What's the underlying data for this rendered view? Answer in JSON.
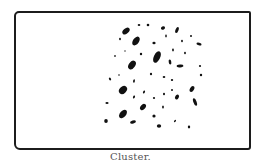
{
  "figure": {
    "caption": "Cluster.",
    "frame": {
      "x": 14,
      "y": 11,
      "width": 233,
      "height": 135,
      "stroke": "#1c1c1c"
    },
    "dot_color": "#111111",
    "dots": [
      {
        "x": 126,
        "y": 31,
        "rx": 4.2,
        "ry": 2.6,
        "rot": -40
      },
      {
        "x": 139,
        "y": 25,
        "rx": 1.3,
        "ry": 1.0,
        "rot": 0
      },
      {
        "x": 148,
        "y": 25,
        "rx": 1.3,
        "ry": 1.2,
        "rot": 0
      },
      {
        "x": 163,
        "y": 28,
        "rx": 2.2,
        "ry": 1.6,
        "rot": -30
      },
      {
        "x": 177,
        "y": 30,
        "rx": 1.5,
        "ry": 3.2,
        "rot": 20
      },
      {
        "x": 120,
        "y": 39,
        "rx": 0.9,
        "ry": 1.3,
        "rot": 0
      },
      {
        "x": 136,
        "y": 41,
        "rx": 3.0,
        "ry": 5.0,
        "rot": 35
      },
      {
        "x": 154,
        "y": 43,
        "rx": 1.6,
        "ry": 1.3,
        "rot": 0
      },
      {
        "x": 166,
        "y": 36,
        "rx": 0.8,
        "ry": 1.4,
        "rot": 0
      },
      {
        "x": 182,
        "y": 41,
        "rx": 0.9,
        "ry": 1.2,
        "rot": 0
      },
      {
        "x": 191,
        "y": 36,
        "rx": 1.0,
        "ry": 0.9,
        "rot": 0
      },
      {
        "x": 199,
        "y": 44,
        "rx": 2.6,
        "ry": 1.4,
        "rot": 15
      },
      {
        "x": 125,
        "y": 51,
        "rx": 0.7,
        "ry": 0.7,
        "rot": 0
      },
      {
        "x": 141,
        "y": 54,
        "rx": 1.2,
        "ry": 1.2,
        "rot": 0
      },
      {
        "x": 157,
        "y": 57,
        "rx": 3.2,
        "ry": 6.2,
        "rot": 25
      },
      {
        "x": 173,
        "y": 50,
        "rx": 0.9,
        "ry": 1.4,
        "rot": 0
      },
      {
        "x": 185,
        "y": 53,
        "rx": 0.9,
        "ry": 1.2,
        "rot": 0
      },
      {
        "x": 115,
        "y": 56,
        "rx": 0.8,
        "ry": 1.0,
        "rot": 0
      },
      {
        "x": 132,
        "y": 65,
        "rx": 3.2,
        "ry": 4.8,
        "rot": 35
      },
      {
        "x": 170,
        "y": 62,
        "rx": 1.3,
        "ry": 2.6,
        "rot": -10
      },
      {
        "x": 180,
        "y": 66,
        "rx": 3.4,
        "ry": 1.4,
        "rot": -5
      },
      {
        "x": 200,
        "y": 66,
        "rx": 1.1,
        "ry": 1.1,
        "rot": 0
      },
      {
        "x": 110,
        "y": 79,
        "rx": 1.0,
        "ry": 1.5,
        "rot": -30
      },
      {
        "x": 119,
        "y": 75,
        "rx": 0.8,
        "ry": 0.8,
        "rot": 0
      },
      {
        "x": 134,
        "y": 81,
        "rx": 0.9,
        "ry": 1.7,
        "rot": 10
      },
      {
        "x": 151,
        "y": 74,
        "rx": 1.1,
        "ry": 1.3,
        "rot": 0
      },
      {
        "x": 164,
        "y": 77,
        "rx": 1.3,
        "ry": 1.1,
        "rot": 0
      },
      {
        "x": 172,
        "y": 80,
        "rx": 1.2,
        "ry": 1.1,
        "rot": 0
      },
      {
        "x": 201,
        "y": 75,
        "rx": 1.2,
        "ry": 1.2,
        "rot": 0
      },
      {
        "x": 123,
        "y": 90,
        "rx": 3.4,
        "ry": 4.6,
        "rot": 45
      },
      {
        "x": 144,
        "y": 92,
        "rx": 0.9,
        "ry": 1.6,
        "rot": 25
      },
      {
        "x": 154,
        "y": 98,
        "rx": 1.1,
        "ry": 1.1,
        "rot": 0
      },
      {
        "x": 164,
        "y": 94,
        "rx": 1.0,
        "ry": 1.3,
        "rot": 0
      },
      {
        "x": 172,
        "y": 90,
        "rx": 1.0,
        "ry": 1.0,
        "rot": 0
      },
      {
        "x": 177,
        "y": 97,
        "rx": 1.8,
        "ry": 2.6,
        "rot": 30
      },
      {
        "x": 192,
        "y": 89,
        "rx": 2.0,
        "ry": 3.2,
        "rot": 30
      },
      {
        "x": 107,
        "y": 103,
        "rx": 1.6,
        "ry": 1.1,
        "rot": 0
      },
      {
        "x": 134,
        "y": 97,
        "rx": 1.0,
        "ry": 1.5,
        "rot": 20
      },
      {
        "x": 143,
        "y": 107,
        "rx": 2.4,
        "ry": 3.6,
        "rot": 40
      },
      {
        "x": 163,
        "y": 107,
        "rx": 0.9,
        "ry": 1.5,
        "rot": 0
      },
      {
        "x": 195,
        "y": 102,
        "rx": 1.6,
        "ry": 4.0,
        "rot": -20
      },
      {
        "x": 123,
        "y": 114,
        "rx": 3.0,
        "ry": 5.0,
        "rot": 40
      },
      {
        "x": 154,
        "y": 116,
        "rx": 1.6,
        "ry": 1.5,
        "rot": 0
      },
      {
        "x": 175,
        "y": 121,
        "rx": 0.8,
        "ry": 1.3,
        "rot": 40
      },
      {
        "x": 106,
        "y": 121,
        "rx": 1.8,
        "ry": 2.1,
        "rot": 0
      },
      {
        "x": 133,
        "y": 122,
        "rx": 3.0,
        "ry": 1.6,
        "rot": -15
      },
      {
        "x": 159,
        "y": 126,
        "rx": 2.2,
        "ry": 1.7,
        "rot": 0
      },
      {
        "x": 189,
        "y": 127,
        "rx": 1.2,
        "ry": 1.4,
        "rot": 0
      }
    ]
  }
}
